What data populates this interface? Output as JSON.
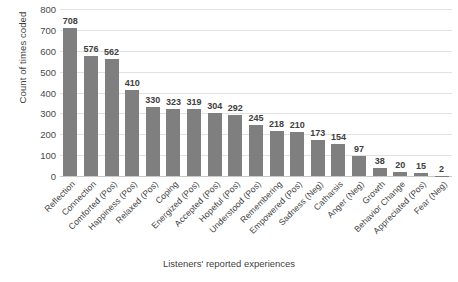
{
  "chart_data": {
    "type": "bar",
    "title": "",
    "xlabel": "Listeners' reported experiences",
    "ylabel": "Count of times coded",
    "ylim": [
      0,
      800
    ],
    "ytick_step": 100,
    "yticks": [
      800,
      700,
      600,
      500,
      400,
      300,
      200,
      100,
      0
    ],
    "grid": true,
    "legend": "none",
    "bar_color": "#7f7f7f",
    "gridline_color": "#e2e2e2",
    "categories": [
      "Reflection",
      "Connection",
      "Comforted (Pos)",
      "Happiness (Pos)",
      "Relaxed (Pos)",
      "Coping",
      "Energized (Pos)",
      "Accepted (Pos)",
      "Hopeful (Pos)",
      "Understood (Pos)",
      "Remembering",
      "Empowered (Pos)",
      "Sadness (Neg)",
      "Catharsis",
      "Anger (Neg)",
      "Growth",
      "Behavior Change",
      "Appreciated (Pos)",
      "Fear (Neg)"
    ],
    "values": [
      708,
      576,
      562,
      410,
      330,
      323,
      319,
      304,
      292,
      245,
      218,
      210,
      173,
      154,
      97,
      38,
      20,
      15,
      2
    ],
    "data_labels": [
      "708",
      "576",
      "562",
      "410",
      "330",
      "323",
      "319",
      "304",
      "292",
      "245",
      "218",
      "210",
      "173",
      "154",
      "97",
      "38",
      "20",
      "15",
      "2"
    ]
  }
}
